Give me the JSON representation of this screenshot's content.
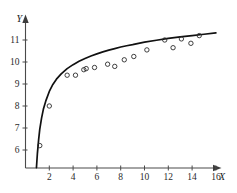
{
  "chart_data": {
    "type": "scatter",
    "title": "",
    "subtitle": "",
    "xlabel": "X",
    "ylabel": "Y",
    "xlim": [
      0,
      17.2
    ],
    "ylim": [
      5.2,
      11.9
    ],
    "grid": false,
    "legend": null,
    "x_ticks": [
      2,
      4,
      6,
      8,
      10,
      12,
      14,
      16
    ],
    "x_tick_labels": [
      "2",
      "4",
      "6",
      "8",
      "10",
      "12",
      "14",
      "16"
    ],
    "y_ticks": [
      6,
      7,
      8,
      9,
      10,
      11
    ],
    "y_tick_labels": [
      "6",
      "7",
      "8",
      "9",
      "10",
      "11"
    ],
    "series": [
      {
        "name": "observations",
        "type": "scatter",
        "marker": "open-circle",
        "x": [
          1.2,
          2.0,
          3.5,
          4.2,
          4.9,
          5.1,
          5.8,
          6.9,
          7.5,
          8.3,
          9.1,
          10.2,
          11.7,
          12.4,
          13.1,
          13.9,
          14.6
        ],
        "y": [
          6.2,
          8.0,
          9.4,
          9.4,
          9.65,
          9.7,
          9.75,
          9.9,
          9.8,
          10.1,
          10.25,
          10.55,
          11.0,
          10.65,
          11.05,
          10.85,
          11.2
        ]
      },
      {
        "name": "fitted-curve",
        "type": "line",
        "x": [
          0.92,
          1.0,
          1.1,
          1.2,
          1.35,
          1.5,
          1.7,
          2.0,
          2.3,
          2.6,
          3.0,
          3.5,
          4.0,
          4.5,
          5.0,
          5.5,
          6.0,
          6.5,
          7.0,
          7.5,
          8.0,
          8.5,
          9.0,
          9.5,
          10.0,
          11.0,
          12.0,
          13.0,
          14.0,
          15.0,
          16.0
        ],
        "y": [
          5.2,
          5.85,
          6.45,
          6.95,
          7.45,
          7.85,
          8.22,
          8.66,
          8.98,
          9.22,
          9.46,
          9.7,
          9.88,
          10.03,
          10.16,
          10.27,
          10.37,
          10.46,
          10.54,
          10.61,
          10.68,
          10.74,
          10.79,
          10.85,
          10.9,
          10.99,
          11.07,
          11.14,
          11.2,
          11.26,
          11.32
        ]
      }
    ]
  },
  "axes": {
    "x_axis_name": "X",
    "y_axis_name": "Y"
  }
}
